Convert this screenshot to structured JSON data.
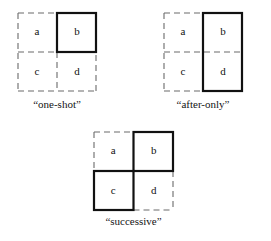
{
  "figure": {
    "background_color": "#ffffff",
    "ink_color": "#111111",
    "solid_stroke_color": "#111111",
    "dashed_stroke_color": "#6b6b6b",
    "solid_stroke_width": 2.2,
    "dashed_stroke_width": 1.1,
    "dash_pattern": "6 4"
  },
  "diagrams": [
    {
      "id": "one-shot",
      "caption": "“one-shot”",
      "cells": [
        {
          "key": "a",
          "label": "a",
          "position": "top-left",
          "emphasis": "dashed"
        },
        {
          "key": "b",
          "label": "b",
          "position": "top-right",
          "emphasis": "solid"
        },
        {
          "key": "c",
          "label": "c",
          "position": "bottom-left",
          "emphasis": "dashed"
        },
        {
          "key": "d",
          "label": "d",
          "position": "bottom-right",
          "emphasis": "dashed"
        }
      ],
      "highlighted_cells": [
        "b"
      ]
    },
    {
      "id": "after-only",
      "caption": "“after-only”",
      "cells": [
        {
          "key": "a",
          "label": "a",
          "position": "top-left",
          "emphasis": "dashed"
        },
        {
          "key": "b",
          "label": "b",
          "position": "top-right",
          "emphasis": "solid"
        },
        {
          "key": "c",
          "label": "c",
          "position": "bottom-left",
          "emphasis": "dashed"
        },
        {
          "key": "d",
          "label": "d",
          "position": "bottom-right",
          "emphasis": "solid"
        }
      ],
      "highlighted_cells": [
        "b",
        "d"
      ]
    },
    {
      "id": "successive",
      "caption": "“successive”",
      "cells": [
        {
          "key": "a",
          "label": "a",
          "position": "top-left",
          "emphasis": "dashed"
        },
        {
          "key": "b",
          "label": "b",
          "position": "top-right",
          "emphasis": "solid"
        },
        {
          "key": "c",
          "label": "c",
          "position": "bottom-left",
          "emphasis": "solid"
        },
        {
          "key": "d",
          "label": "d",
          "position": "bottom-right",
          "emphasis": "dashed"
        }
      ],
      "highlighted_cells": [
        "b",
        "c"
      ]
    }
  ]
}
